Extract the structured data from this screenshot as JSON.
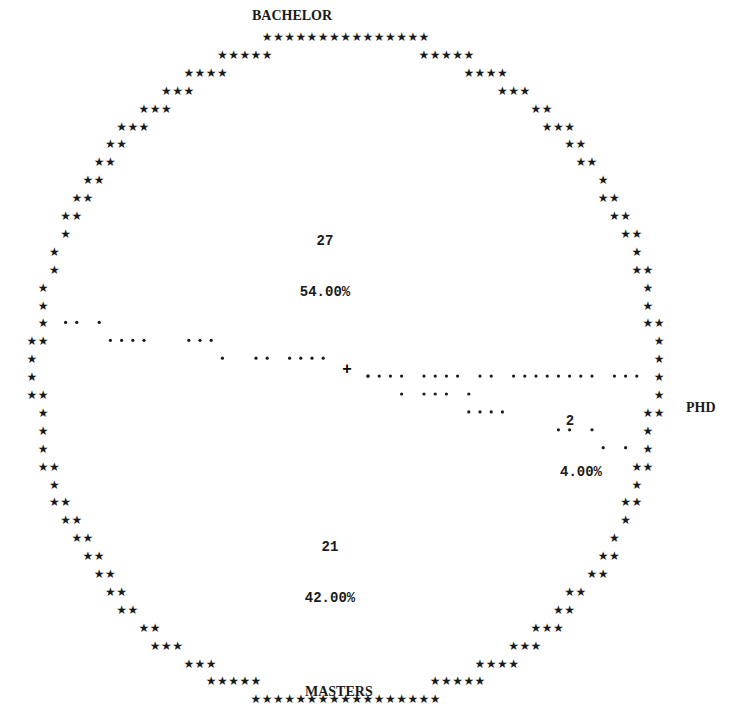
{
  "chart_data": {
    "type": "pie",
    "title": "",
    "style": "character-plot",
    "categories": [
      "BACHELOR",
      "PHD",
      "MASTERS"
    ],
    "values": [
      27,
      2,
      21
    ],
    "percents": [
      "54.00%",
      "4.00%",
      "42.00%"
    ],
    "series": [
      {
        "name": "BACHELOR",
        "frequency": "27",
        "percent": "54.00%"
      },
      {
        "name": "PHD",
        "frequency": "2",
        "percent": "4.00%"
      },
      {
        "name": "MASTERS",
        "frequency": "21",
        "percent": "42.00%"
      }
    ],
    "outline_char": "*",
    "divider_char": ".",
    "center_char": "+"
  },
  "rows": [
    "             *************",
    "     *****                 *****",
    "  ***                           ***",
    " ***                               ***",
    " **                                   **",
    " *                                     *",
    "**                                     **",
    "*                                       *",
    "**                                     **",
    "*                                       *",
    "*                                       **",
    "**                                      *",
    "*                                       **",
    "*                                       *",
    "*                                       *",
    "*                                       *",
    "*                                       *",
    "*                                       *",
    "*                                       *"
  ]
}
